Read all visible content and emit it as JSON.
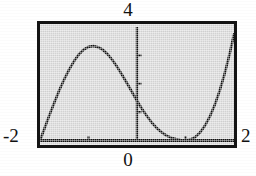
{
  "figure": {
    "kind": "graphing-calculator-window",
    "background_color": "#ffffff",
    "plot_fill_color": "#d2d2d2",
    "frame_color": "#141414",
    "curve_color": "#101010"
  },
  "labels": {
    "y_max": "4",
    "x_min": "-2",
    "x_max": "2",
    "origin": "0"
  },
  "chart_data": {
    "type": "line",
    "title": "",
    "xlabel": "",
    "ylabel": "",
    "xlim": [
      -2,
      2
    ],
    "ylim": [
      0,
      4
    ],
    "grid": false,
    "legend": null,
    "axes": {
      "y_axis_drawn_at_x": 0,
      "x_axis_drawn_at_y": 0,
      "y_axis_top_value": 4,
      "x_tick_values": [
        -1,
        1
      ],
      "y_tick_values": [
        1,
        2,
        3
      ]
    },
    "annotations": [
      {
        "text": "4",
        "position": "top-center",
        "meaning": "y-axis maximum"
      },
      {
        "text": "-2",
        "position": "left-bottom",
        "meaning": "x-axis minimum"
      },
      {
        "text": "2",
        "position": "right-bottom",
        "meaning": "x-axis maximum"
      },
      {
        "text": "0",
        "position": "bottom-center",
        "meaning": "origin / x=0"
      }
    ],
    "series": [
      {
        "name": "curve",
        "x": [
          -2.0,
          -1.9,
          -1.8,
          -1.7,
          -1.6,
          -1.5,
          -1.4,
          -1.3,
          -1.2,
          -1.1,
          -1.0,
          -0.9,
          -0.8,
          -0.7,
          -0.6,
          -0.5,
          -0.4,
          -0.3,
          -0.2,
          -0.1,
          0.0,
          0.1,
          0.2,
          0.3,
          0.4,
          0.5,
          0.6,
          0.7,
          0.8,
          0.9,
          1.0,
          1.1,
          1.2,
          1.3,
          1.4,
          1.5,
          1.6,
          1.7,
          1.8,
          1.9,
          2.0
        ],
        "y": [
          0.0,
          0.46,
          0.92,
          1.36,
          1.78,
          2.16,
          2.5,
          2.79,
          3.03,
          3.2,
          3.3,
          3.33,
          3.29,
          3.19,
          3.03,
          2.82,
          2.57,
          2.29,
          2.0,
          1.7,
          1.4,
          1.12,
          0.87,
          0.64,
          0.45,
          0.3,
          0.18,
          0.1,
          0.05,
          0.02,
          0.0,
          0.03,
          0.12,
          0.28,
          0.52,
          0.84,
          1.24,
          1.73,
          2.31,
          2.98,
          3.74
        ]
      }
    ]
  }
}
